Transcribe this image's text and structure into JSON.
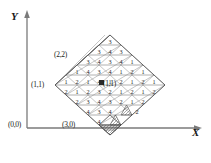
{
  "figure": {
    "kind": "triangular-grid-diamond",
    "axes": {
      "x_label": "X",
      "y_label": "Y"
    },
    "point_labels": [
      {
        "id": "origin",
        "text": "(0,0)"
      },
      {
        "id": "p11",
        "text": "(1,1)"
      },
      {
        "id": "p22",
        "text": "(2,2)"
      },
      {
        "id": "p30",
        "text": "(3,0)"
      },
      {
        "id": "center",
        "text": "(1,1)"
      }
    ],
    "rows": [
      {
        "index": 0,
        "values": [
          "3"
        ]
      },
      {
        "index": 1,
        "values": [
          "3",
          "4",
          "3"
        ]
      },
      {
        "index": 2,
        "values": [
          "3",
          "4",
          "3",
          "4",
          "1"
        ]
      },
      {
        "index": 3,
        "values": [
          "1",
          "4",
          "3",
          "4",
          "1",
          "2",
          "1"
        ]
      },
      {
        "index": 4,
        "values": [
          "1",
          "2",
          "1",
          "4",
          "1",
          "2",
          "1",
          "2",
          "1"
        ]
      },
      {
        "index": 5,
        "values": [
          "2",
          "1",
          "2",
          "3",
          "2",
          "1",
          "2",
          "1",
          "2"
        ]
      },
      {
        "index": 6,
        "values": [
          "2",
          "3",
          "4",
          "3",
          "2",
          "1",
          "2"
        ]
      },
      {
        "index": 7,
        "values": [
          "4",
          "3",
          "4",
          "",
          "2"
        ]
      },
      {
        "index": 8,
        "values": [
          "4",
          ""
        ]
      }
    ],
    "shaded_cells": [
      "row7-col3",
      "row8-col1",
      "row8-col1-lower"
    ],
    "colors": {
      "grid": "#6e6e6e",
      "outline": "#4a4a4a",
      "axis": "#7a7a7a",
      "text": "#1c1c1c",
      "marker": "#2b2b2b"
    }
  }
}
